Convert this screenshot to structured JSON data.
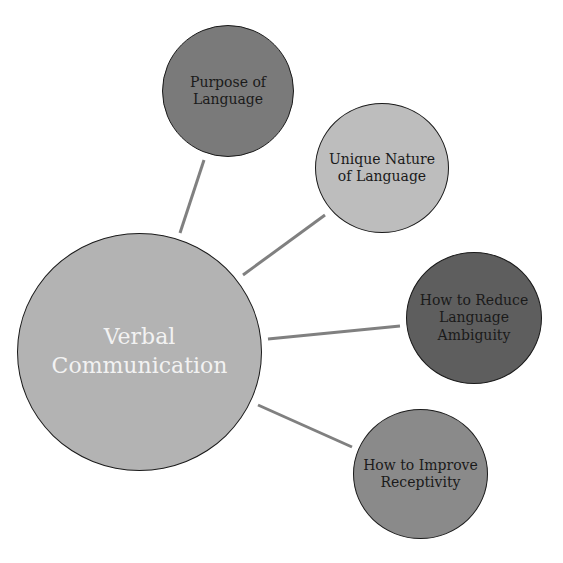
{
  "diagram": {
    "type": "hub-and-spoke mind map",
    "center": {
      "label": "Verbal Communication",
      "lines": [
        "Verbal",
        "Communication"
      ],
      "fill": "#b3b3b3",
      "text_color": "#f2f2f2",
      "cx": 139,
      "cy": 352,
      "r": 120
    },
    "branches": [
      {
        "id": "purpose",
        "label": "Purpose of Language",
        "lines": [
          "Purpose of",
          "Language"
        ],
        "fill": "#7a7a7a",
        "cx": 229,
        "cy": 91,
        "r": 66,
        "connector": {
          "x1": 180,
          "y1": 233,
          "x2": 204,
          "y2": 160
        }
      },
      {
        "id": "unique",
        "label": "Unique Nature of Language",
        "lines": [
          "Unique Nature",
          "of Language"
        ],
        "fill": "#bdbdbd",
        "cx": 382,
        "cy": 168,
        "r": 66,
        "connector": {
          "x1": 243,
          "y1": 275,
          "x2": 325,
          "y2": 215
        }
      },
      {
        "id": "reduce",
        "label": "How to Reduce Language Ambiguity",
        "lines": [
          "How to Reduce",
          "Language",
          "Ambiguity"
        ],
        "fill": "#5e5e5e",
        "cx": 474,
        "cy": 318,
        "r": 67,
        "connector": {
          "x1": 268,
          "y1": 339,
          "x2": 400,
          "y2": 326
        }
      },
      {
        "id": "improve",
        "label": "How to Improve Receptivity",
        "lines": [
          "How to Improve",
          "Receptivity"
        ],
        "fill": "#8a8a8a",
        "cx": 421,
        "cy": 474,
        "r": 66,
        "connector": {
          "x1": 258,
          "y1": 405,
          "x2": 352,
          "y2": 447
        }
      }
    ],
    "connector_color": "#808080"
  }
}
